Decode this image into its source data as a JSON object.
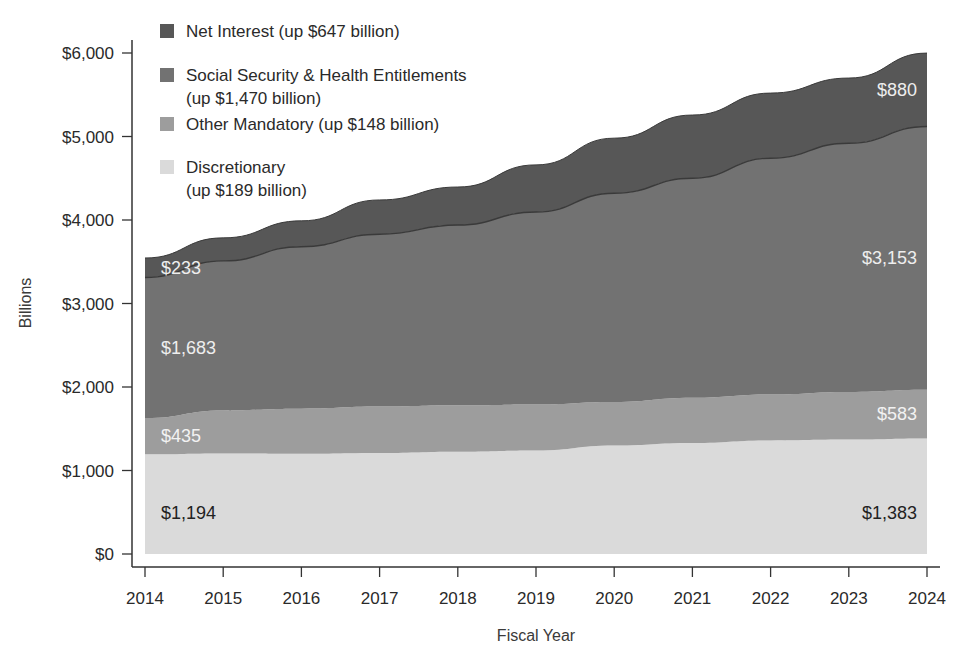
{
  "chart_data": {
    "type": "area",
    "stacked": true,
    "title": "",
    "xlabel": "Fiscal Year",
    "ylabel": "Billions",
    "ylim": [
      0,
      6000
    ],
    "yticks": [
      0,
      1000,
      2000,
      3000,
      4000,
      5000,
      6000
    ],
    "ytick_labels": [
      "$0",
      "$1,000",
      "$2,000",
      "$3,000",
      "$4,000",
      "$5,000",
      "$6,000"
    ],
    "categories": [
      "2014",
      "2015",
      "2016",
      "2017",
      "2018",
      "2019",
      "2020",
      "2021",
      "2022",
      "2023",
      "2024"
    ],
    "grid": false,
    "legend_position": "top-left (inside)",
    "series": [
      {
        "name": "Discretionary",
        "legend_label": [
          "Discretionary",
          "(up $189 billion)"
        ],
        "color": "#dadada",
        "values": [
          1194,
          1205,
          1200,
          1210,
          1225,
          1240,
          1300,
          1330,
          1360,
          1370,
          1383
        ],
        "start_label": "$1,194",
        "end_label": "$1,383",
        "label_color": "#222222"
      },
      {
        "name": "Other Mandatory",
        "legend_label": [
          "Other Mandatory (up $148 billion)"
        ],
        "color": "#9d9d9d",
        "values": [
          435,
          515,
          540,
          555,
          555,
          550,
          520,
          540,
          550,
          570,
          583
        ],
        "start_label": "$435",
        "end_label": "$583",
        "label_color": "#f2f2f2"
      },
      {
        "name": "Social Security & Health Entitlements",
        "legend_label": [
          "Social Security & Health Entitlements",
          "(up $1,470 billion)"
        ],
        "color": "#727272",
        "values": [
          1683,
          1790,
          1940,
          2065,
          2160,
          2305,
          2500,
          2630,
          2830,
          2980,
          3153
        ],
        "start_label": "$1,683",
        "end_label": "$3,153",
        "label_color": "#eeeeee"
      },
      {
        "name": "Net Interest",
        "legend_label": [
          "Net Interest (up $647 billion)"
        ],
        "color": "#575757",
        "values": [
          233,
          276,
          310,
          410,
          455,
          565,
          660,
          757,
          780,
          780,
          880
        ],
        "start_label": "$233",
        "end_label": "$880",
        "label_color": "#eeeeee"
      }
    ]
  },
  "legend_order": [
    3,
    2,
    1,
    0
  ]
}
